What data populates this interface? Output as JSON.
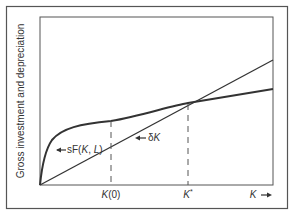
{
  "diagram": {
    "ylabel": "Gross investment and depreciation",
    "xaxis_arrow_label": "K",
    "curves": {
      "production": {
        "label_prefix": "sF(",
        "label_k": "K",
        "label_sep": ", ",
        "label_l": "L",
        "label_suffix": ")"
      },
      "depreciation": {
        "label_prefix": "δ",
        "label_k": "K"
      }
    },
    "ticks": {
      "k0": {
        "label_k": "K",
        "label_rest": "(0)"
      },
      "kstar": {
        "label_k": "K",
        "label_sup": "*"
      }
    },
    "colors": {
      "line": "#333333",
      "frame": "#555555",
      "text": "#333333"
    }
  }
}
